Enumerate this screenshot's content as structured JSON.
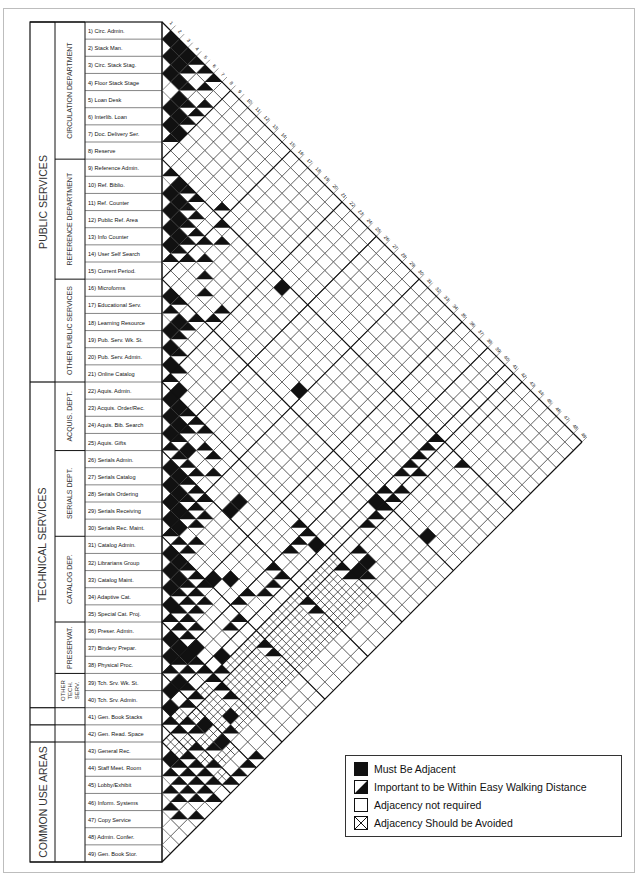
{
  "groups": [
    {
      "label": "PUBLIC SERVICES",
      "from": 1,
      "to": 21
    },
    {
      "label": "TECHNICAL SERVICES",
      "from": 22,
      "to": 40
    },
    {
      "label": "",
      "from": 41,
      "to": 41
    },
    {
      "label": "",
      "from": 42,
      "to": 42
    },
    {
      "label": "COMMON USE AREAS",
      "from": 43,
      "to": 49
    }
  ],
  "departments": [
    {
      "label": "CIRCULATION DEPARTMENT",
      "from": 1,
      "to": 8
    },
    {
      "label": "REFERENCE DEPARTMENT",
      "from": 9,
      "to": 15
    },
    {
      "label": "OTHER PUBLIC SERVICES",
      "from": 16,
      "to": 21
    },
    {
      "label": "ACQUIS. DEPT.",
      "from": 22,
      "to": 25
    },
    {
      "label": "SERIALS DEPT.",
      "from": 26,
      "to": 30
    },
    {
      "label": "CATALOG DEP.",
      "from": 31,
      "to": 35
    },
    {
      "label": "PRESERVAT.",
      "from": 36,
      "to": 38
    },
    {
      "label": "OTHER TECH. SERV.",
      "from": 39,
      "to": 40
    },
    {
      "label": "",
      "from": 41,
      "to": 41
    },
    {
      "label": "",
      "from": 42,
      "to": 42
    },
    {
      "label": "",
      "from": 43,
      "to": 49
    }
  ],
  "spaces": [
    "1) Circ. Admin.",
    "2) Stack Man.",
    "3) Circ. Stack Stag.",
    "4) Floor Stack Stage",
    "5) Loan Desk",
    "6) Interlib. Loan",
    "7) Doc. Delivery Ser.",
    "8) Reserve",
    "9) Reference Admin.",
    "10) Ref. Biblio.",
    "11) Ref. Counter",
    "12) Public Ref. Area",
    "13) Info Counter",
    "14) User Self Search",
    "15) Current Period.",
    "16) Microforms",
    "17) Educational Serv.",
    "18) Learning Resource",
    "19) Pub. Serv. Wk. St.",
    "20) Pub. Serv. Admin.",
    "21) Online Catalog",
    "22) Aquis. Admin.",
    "23) Acquis. Order/Rec.",
    "24) Aquis. Bib. Search",
    "25) Aquis. Gifts",
    "26) Serials Admin.",
    "27) Serials Catalog",
    "28) Serials Ordering",
    "29) Serials Receiving",
    "30) Serials Rec. Maint.",
    "31) Catalog Admin.",
    "32) Librarians Group",
    "33) Catalog Maint.",
    "34) Adaptive Cat.",
    "35) Special Cat. Proj.",
    "36) Preser. Admin.",
    "37) Bindery Prepar.",
    "38) Physical Proc.",
    "39) Tch. Srv. Wk. St.",
    "40) Tch. Srv. Admin.",
    "41) Gen. Book Stacks",
    "42) Gen. Read. Space",
    "43) General Rec.",
    "44) Staff Meet. Room",
    "45) Lobby/Exhibit",
    "46) Inform. Systems",
    "47) Copy Service",
    "48) Admin. Confer.",
    "49) Gen. Book Stor."
  ],
  "legend": [
    {
      "key": "M",
      "label": "Must Be Adjacent"
    },
    {
      "key": "I",
      "label": "Important to be Within Easy Walking Distance"
    },
    {
      "key": "N",
      "label": "Adjacency not required"
    },
    {
      "key": "X",
      "label": "Adjacency Should be Avoided"
    }
  ],
  "colors": {
    "ink": "#111111",
    "grid": "#333333",
    "paper": "#ffffff",
    "frame": "#bdbdbd"
  },
  "cells": {
    "M": [
      [
        1,
        2
      ],
      [
        1,
        3
      ],
      [
        2,
        3
      ],
      [
        2,
        4
      ],
      [
        3,
        4
      ],
      [
        3,
        5
      ],
      [
        1,
        4
      ],
      [
        4,
        6
      ],
      [
        5,
        6
      ],
      [
        5,
        7
      ],
      [
        6,
        7
      ],
      [
        6,
        8
      ],
      [
        10,
        11
      ],
      [
        11,
        12
      ],
      [
        10,
        12
      ],
      [
        11,
        13
      ],
      [
        12,
        13
      ],
      [
        12,
        14
      ],
      [
        9,
        11
      ],
      [
        13,
        14
      ],
      [
        16,
        17
      ],
      [
        17,
        19
      ],
      [
        18,
        19
      ],
      [
        19,
        20
      ],
      [
        20,
        21
      ],
      [
        22,
        23
      ],
      [
        23,
        24
      ],
      [
        22,
        24
      ],
      [
        23,
        25
      ],
      [
        24,
        25
      ],
      [
        9,
        23
      ],
      [
        21,
        23
      ],
      [
        26,
        27
      ],
      [
        27,
        28
      ],
      [
        26,
        28
      ],
      [
        28,
        29
      ],
      [
        29,
        30
      ],
      [
        27,
        29
      ],
      [
        28,
        30
      ],
      [
        24,
        27
      ],
      [
        14,
        30
      ],
      [
        31,
        32
      ],
      [
        32,
        33
      ],
      [
        31,
        33
      ],
      [
        33,
        34
      ],
      [
        34,
        35
      ],
      [
        32,
        34
      ],
      [
        24,
        33
      ],
      [
        25,
        33
      ],
      [
        29,
        31
      ],
      [
        36,
        37
      ],
      [
        37,
        38
      ],
      [
        36,
        38
      ],
      [
        30,
        36
      ],
      [
        29,
        37
      ],
      [
        39,
        40
      ],
      [
        38,
        40
      ],
      [
        22,
        40
      ],
      [
        35,
        39
      ],
      [
        36,
        39
      ],
      [
        34,
        41
      ],
      [
        37,
        42
      ],
      [
        40,
        41
      ],
      [
        16,
        41
      ],
      [
        43,
        44
      ],
      [
        39,
        44
      ],
      [
        37,
        45
      ],
      [
        20,
        44
      ],
      [
        21,
        44
      ],
      [
        15,
        46
      ],
      [
        39,
        46
      ]
    ],
    "I": [
      [
        1,
        5
      ],
      [
        2,
        5
      ],
      [
        3,
        6
      ],
      [
        4,
        7
      ],
      [
        4,
        8
      ],
      [
        5,
        8
      ],
      [
        1,
        6
      ],
      [
        2,
        7
      ],
      [
        7,
        8
      ],
      [
        3,
        8
      ],
      [
        1,
        7
      ],
      [
        9,
        10
      ],
      [
        9,
        12
      ],
      [
        10,
        13
      ],
      [
        11,
        14
      ],
      [
        12,
        15
      ],
      [
        13,
        15
      ],
      [
        9,
        13
      ],
      [
        10,
        14
      ],
      [
        13,
        16
      ],
      [
        14,
        15
      ],
      [
        9,
        16
      ],
      [
        11,
        16
      ],
      [
        16,
        18
      ],
      [
        17,
        18
      ],
      [
        16,
        20
      ],
      [
        18,
        20
      ],
      [
        19,
        21
      ],
      [
        17,
        20
      ],
      [
        12,
        17
      ],
      [
        13,
        18
      ],
      [
        14,
        21
      ],
      [
        8,
        15
      ],
      [
        11,
        15
      ],
      [
        14,
        19
      ],
      [
        15,
        21
      ],
      [
        10,
        17
      ],
      [
        22,
        25
      ],
      [
        21,
        22
      ],
      [
        20,
        22
      ],
      [
        22,
        26
      ],
      [
        23,
        26
      ],
      [
        24,
        26
      ],
      [
        25,
        26
      ],
      [
        22,
        27
      ],
      [
        23,
        28
      ],
      [
        25,
        27
      ],
      [
        26,
        29
      ],
      [
        26,
        30
      ],
      [
        27,
        30
      ],
      [
        25,
        28
      ],
      [
        25,
        29
      ],
      [
        24,
        30
      ],
      [
        23,
        29
      ],
      [
        26,
        31
      ],
      [
        27,
        31
      ],
      [
        28,
        31
      ],
      [
        30,
        31
      ],
      [
        27,
        32
      ],
      [
        28,
        32
      ],
      [
        31,
        34
      ],
      [
        31,
        35
      ],
      [
        32,
        35
      ],
      [
        33,
        35
      ],
      [
        30,
        32
      ],
      [
        29,
        33
      ],
      [
        30,
        33
      ],
      [
        31,
        36
      ],
      [
        32,
        36
      ],
      [
        33,
        36
      ],
      [
        34,
        36
      ],
      [
        35,
        36
      ],
      [
        33,
        37
      ],
      [
        34,
        37
      ],
      [
        35,
        37
      ],
      [
        35,
        38
      ],
      [
        32,
        37
      ],
      [
        34,
        38
      ],
      [
        36,
        40
      ],
      [
        37,
        39
      ],
      [
        37,
        40
      ],
      [
        38,
        39
      ],
      [
        31,
        40
      ],
      [
        32,
        40
      ],
      [
        22,
        38
      ],
      [
        26,
        40
      ],
      [
        27,
        40
      ],
      [
        28,
        40
      ],
      [
        22,
        39
      ],
      [
        23,
        39
      ],
      [
        24,
        39
      ],
      [
        29,
        39
      ],
      [
        30,
        39
      ],
      [
        26,
        39
      ],
      [
        9,
        41
      ],
      [
        10,
        41
      ],
      [
        11,
        41
      ],
      [
        12,
        41
      ],
      [
        13,
        41
      ],
      [
        15,
        41
      ],
      [
        16,
        42
      ],
      [
        12,
        42
      ],
      [
        14,
        42
      ],
      [
        15,
        42
      ],
      [
        17,
        42
      ],
      [
        18,
        42
      ],
      [
        41,
        42
      ],
      [
        35,
        42
      ],
      [
        36,
        42
      ],
      [
        38,
        42
      ],
      [
        39,
        42
      ],
      [
        38,
        41
      ],
      [
        36,
        41
      ],
      [
        20,
        43
      ],
      [
        31,
        43
      ],
      [
        22,
        43
      ],
      [
        26,
        43
      ],
      [
        36,
        43
      ],
      [
        40,
        43
      ],
      [
        41,
        43
      ],
      [
        9,
        44
      ],
      [
        22,
        44
      ],
      [
        26,
        44
      ],
      [
        31,
        44
      ],
      [
        36,
        44
      ],
      [
        40,
        44
      ],
      [
        41,
        45
      ],
      [
        42,
        45
      ],
      [
        43,
        45
      ],
      [
        44,
        45
      ],
      [
        21,
        45
      ],
      [
        42,
        46
      ],
      [
        40,
        46
      ],
      [
        43,
        46
      ],
      [
        44,
        46
      ],
      [
        45,
        46
      ],
      [
        38,
        46
      ],
      [
        42,
        47
      ],
      [
        43,
        47
      ],
      [
        44,
        47
      ],
      [
        45,
        47
      ],
      [
        46,
        47
      ],
      [
        41,
        47
      ],
      [
        42,
        48
      ],
      [
        43,
        48
      ],
      [
        44,
        48
      ],
      [
        38,
        49
      ],
      [
        39,
        49
      ],
      [
        41,
        49
      ],
      [
        43,
        49
      ],
      [
        40,
        49
      ],
      [
        45,
        49
      ],
      [
        46,
        48
      ]
    ],
    "X": [
      [
        40,
        42
      ],
      [
        39,
        43
      ],
      [
        38,
        43
      ],
      [
        38,
        44
      ],
      [
        37,
        43
      ],
      [
        37,
        44
      ],
      [
        36,
        45
      ],
      [
        35,
        43
      ],
      [
        35,
        44
      ],
      [
        35,
        45
      ],
      [
        35,
        46
      ],
      [
        34,
        42
      ],
      [
        34,
        43
      ],
      [
        34,
        44
      ],
      [
        34,
        45
      ],
      [
        34,
        46
      ],
      [
        33,
        42
      ],
      [
        33,
        43
      ],
      [
        33,
        44
      ],
      [
        33,
        45
      ],
      [
        33,
        46
      ],
      [
        32,
        42
      ],
      [
        32,
        43
      ],
      [
        32,
        44
      ],
      [
        32,
        45
      ],
      [
        32,
        46
      ],
      [
        31,
        42
      ],
      [
        31,
        45
      ],
      [
        31,
        46
      ],
      [
        30,
        42
      ],
      [
        30,
        43
      ],
      [
        30,
        44
      ],
      [
        30,
        45
      ],
      [
        30,
        46
      ],
      [
        29,
        42
      ],
      [
        29,
        43
      ],
      [
        29,
        44
      ],
      [
        29,
        45
      ],
      [
        29,
        46
      ],
      [
        28,
        42
      ],
      [
        28,
        43
      ],
      [
        28,
        44
      ],
      [
        28,
        45
      ],
      [
        28,
        46
      ],
      [
        27,
        42
      ],
      [
        27,
        43
      ],
      [
        27,
        44
      ],
      [
        27,
        45
      ],
      [
        27,
        46
      ],
      [
        26,
        42
      ],
      [
        26,
        45
      ],
      [
        26,
        46
      ],
      [
        25,
        42
      ],
      [
        25,
        43
      ],
      [
        25,
        44
      ],
      [
        25,
        45
      ],
      [
        25,
        46
      ],
      [
        24,
        42
      ],
      [
        24,
        43
      ],
      [
        24,
        44
      ],
      [
        24,
        45
      ],
      [
        24,
        46
      ],
      [
        23,
        42
      ],
      [
        23,
        43
      ],
      [
        23,
        44
      ],
      [
        23,
        45
      ],
      [
        23,
        46
      ],
      [
        22,
        42
      ],
      [
        22,
        45
      ],
      [
        22,
        46
      ],
      [
        36,
        46
      ],
      [
        37,
        46
      ],
      [
        39,
        45
      ],
      [
        40,
        45
      ],
      [
        38,
        45
      ],
      [
        37,
        42
      ],
      [
        39,
        47
      ],
      [
        40,
        47
      ],
      [
        41,
        46
      ],
      [
        41,
        44
      ],
      [
        42,
        43
      ],
      [
        42,
        44
      ],
      [
        41,
        48
      ]
    ]
  }
}
